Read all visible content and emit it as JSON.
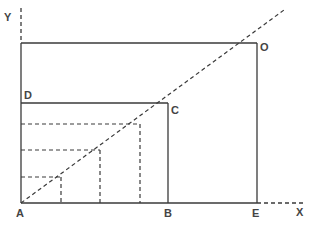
{
  "diagram": {
    "type": "geometric-construction",
    "colors": {
      "line": "#3a3a3a",
      "dashed": "#3a3a3a",
      "label": "#444444",
      "background": "#ffffff"
    },
    "axes": {
      "x_label": "X",
      "y_label": "Y"
    },
    "points": {
      "A": {
        "label": "A"
      },
      "B": {
        "label": "B"
      },
      "C": {
        "label": "C"
      },
      "D": {
        "label": "D"
      },
      "E": {
        "label": "E"
      },
      "O": {
        "label": "O"
      }
    }
  }
}
